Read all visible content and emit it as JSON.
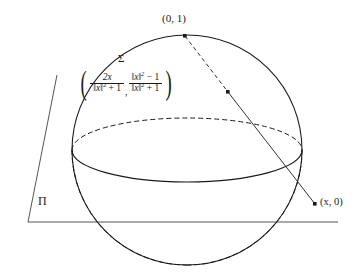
{
  "figure": {
    "type": "geometry-diagram",
    "background_color": "#ffffff",
    "stroke_color": "#1a1a1a",
    "plane_stroke_color": "#555555"
  },
  "labels": {
    "north_pole": "(0, 1)",
    "image_point": "(x, 0)",
    "sphere": "Σ",
    "plane": "Π"
  },
  "formula": {
    "open_paren": "(",
    "close_paren": ")",
    "first_numerator": "2x",
    "first_denominator_norm": "‖x‖",
    "first_denominator_exp": "2",
    "first_denominator_tail": " + 1",
    "comma": ",",
    "second_numerator_norm": "‖x‖",
    "second_numerator_exp": "2",
    "second_numerator_tail": " − 1",
    "second_denominator_norm": "‖x‖",
    "second_denominator_exp": "2",
    "second_denominator_tail": " + 1"
  },
  "geometry": {
    "sphere_center_x": 187,
    "sphere_center_y": 150,
    "sphere_radius": 115,
    "north_pole_x": 185,
    "north_pole_y": 36,
    "projected_point_x": 228,
    "projected_point_y": 92,
    "image_point_x": 315,
    "image_point_y": 204,
    "plane_line_y": 222,
    "plane_line_x_start": 28,
    "plane_line_x_end": 338,
    "plane_left_edge_top_x": 57,
    "plane_left_edge_top_y": 75,
    "equator_ry": 32
  }
}
